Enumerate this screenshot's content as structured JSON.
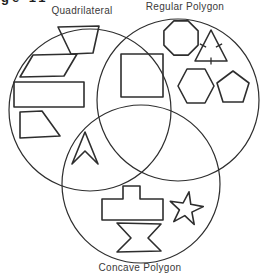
{
  "corner_fragment": "ge 11",
  "diagram": {
    "stroke_color": "#2e2e2e",
    "background_color": "#ffffff",
    "sets": [
      {
        "name": "quadrilateral",
        "label": "Quadrilateral",
        "circle": {
          "cx": 90,
          "cy": 110,
          "r": 81
        }
      },
      {
        "name": "regular-polygon",
        "label": "Regular Polygon",
        "circle": {
          "cx": 178,
          "cy": 100,
          "r": 81
        }
      },
      {
        "name": "concave-polygon",
        "label": "Concave Polygon",
        "circle": {
          "cx": 141,
          "cy": 184,
          "r": 79
        }
      }
    ],
    "shapes": [
      {
        "name": "trapezoid",
        "region": "quadrilateral-only",
        "points": [
          [
            58,
            27
          ],
          [
            99,
            26
          ],
          [
            93,
            53
          ],
          [
            71,
            54
          ]
        ]
      },
      {
        "name": "parallelogram",
        "region": "quadrilateral-only",
        "points": [
          [
            33,
            55
          ],
          [
            77,
            54
          ],
          [
            64,
            76
          ],
          [
            20,
            77
          ]
        ]
      },
      {
        "name": "rectangle",
        "region": "quadrilateral-only",
        "points": [
          [
            14,
            82
          ],
          [
            84,
            82
          ],
          [
            84,
            107
          ],
          [
            14,
            107
          ]
        ]
      },
      {
        "name": "right-trapezoid",
        "region": "quadrilateral-only",
        "points": [
          [
            20,
            112
          ],
          [
            42,
            111
          ],
          [
            60,
            136
          ],
          [
            20,
            138
          ]
        ]
      },
      {
        "name": "square",
        "region": "quadrilateral-and-regular-polygon",
        "points": [
          [
            121,
            54
          ],
          [
            163,
            54
          ],
          [
            163,
            97
          ],
          [
            121,
            97
          ]
        ]
      },
      {
        "name": "octagon",
        "region": "regular-polygon-only",
        "points": [
          [
            198.1,
            30.9
          ],
          [
            188.1,
            20.9
          ],
          [
            173.9,
            20.9
          ],
          [
            163.9,
            30.9
          ],
          [
            163.9,
            45.1
          ],
          [
            173.9,
            55.1
          ],
          [
            188.1,
            55.1
          ],
          [
            198.1,
            45.1
          ]
        ]
      },
      {
        "name": "equilateral-triangle",
        "region": "regular-polygon-only",
        "points": [
          [
            211,
            30
          ],
          [
            227,
            61
          ],
          [
            195,
            61
          ]
        ],
        "ticks": [
          [
            199.9,
            43.9,
            206.1,
            47.1
          ],
          [
            222.1,
            43.9,
            215.9,
            47.1
          ],
          [
            211,
            57.5,
            211,
            64.5
          ]
        ]
      },
      {
        "name": "hexagon",
        "region": "regular-polygon-only",
        "points": [
          [
            178,
            86
          ],
          [
            187,
            69
          ],
          [
            205,
            69
          ],
          [
            214,
            86
          ],
          [
            205,
            103
          ],
          [
            187,
            103
          ]
        ]
      },
      {
        "name": "pentagon",
        "region": "regular-polygon-only",
        "points": [
          [
            233,
            71
          ],
          [
            249,
            83
          ],
          [
            243,
            102
          ],
          [
            223,
            102
          ],
          [
            217,
            83
          ]
        ]
      },
      {
        "name": "dart-arrowhead",
        "region": "quadrilateral-and-concave-polygon",
        "points": [
          [
            85,
            132
          ],
          [
            98,
            164
          ],
          [
            85,
            151
          ],
          [
            72,
            164
          ]
        ]
      },
      {
        "name": "t-block",
        "region": "concave-polygon-only",
        "points": [
          [
            102,
            199
          ],
          [
            123,
            199
          ],
          [
            123,
            186
          ],
          [
            140,
            186
          ],
          [
            140,
            199
          ],
          [
            163,
            199
          ],
          [
            163,
            220
          ],
          [
            102,
            220
          ]
        ]
      },
      {
        "name": "hourglass",
        "region": "concave-polygon-only",
        "points": [
          [
            117,
            223
          ],
          [
            161,
            224
          ],
          [
            148,
            238
          ],
          [
            161,
            251
          ],
          [
            117,
            252
          ],
          [
            131,
            238
          ]
        ]
      },
      {
        "name": "five-point-star",
        "region": "concave-polygon-only",
        "points": [
          [
            189,
            191.8
          ],
          [
            190.8,
            204.3
          ],
          [
            203.3,
            206.6
          ],
          [
            191.9,
            212.1
          ],
          [
            194.2,
            224.5
          ],
          [
            184.8,
            215.6
          ],
          [
            173.8,
            221.6
          ],
          [
            179.4,
            209.9
          ],
          [
            170.3,
            201.3
          ],
          [
            183.1,
            203
          ]
        ]
      }
    ]
  }
}
